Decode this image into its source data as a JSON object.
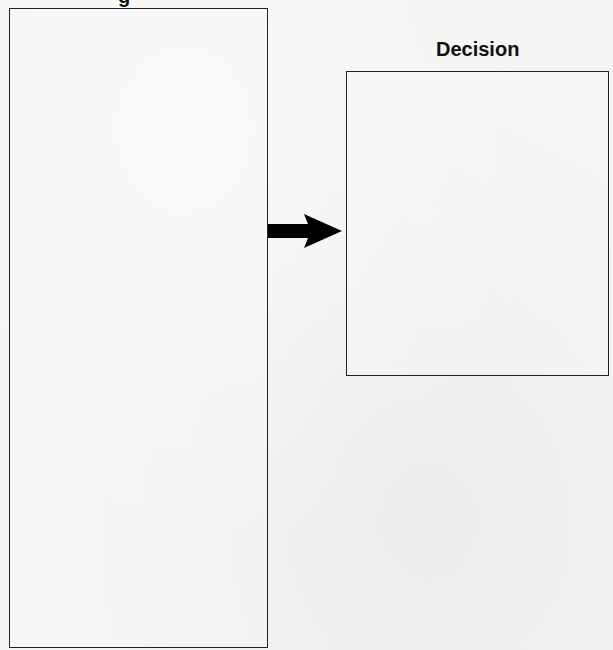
{
  "diagram": {
    "left_panel": {
      "title_fragment": "g",
      "title_visible": "partially cut off at top edge"
    },
    "connector": {
      "type": "arrow",
      "direction": "right",
      "color": "#000000"
    },
    "right_panel": {
      "title": "Decision"
    }
  },
  "colors": {
    "background": "#f4f4f3",
    "border": "#222222",
    "text": "#111111"
  }
}
